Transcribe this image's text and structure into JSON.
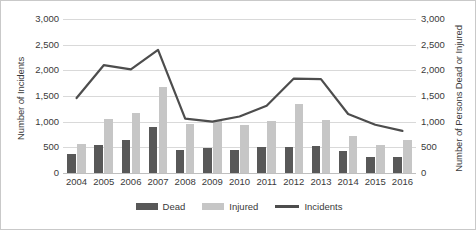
{
  "chart_data": {
    "type": "bar",
    "title": "",
    "subtitle": "",
    "xlabel": "",
    "ylabel": "Number of Incidents",
    "y2label": "Number of Persons Dead or Injured",
    "categories": [
      "2004",
      "2005",
      "2006",
      "2007",
      "2008",
      "2009",
      "2010",
      "2011",
      "2012",
      "2013",
      "2014",
      "2015",
      "2016"
    ],
    "ylim": [
      0,
      3000
    ],
    "y2lim": [
      0,
      3000
    ],
    "yticks": [
      0,
      500,
      1000,
      1500,
      2000,
      2500,
      3000
    ],
    "ytick_labels": [
      "0",
      "500",
      "1,000",
      "1,500",
      "2,000",
      "2,500",
      "3,000"
    ],
    "y2tick_labels": [
      "0",
      "500",
      "1,000",
      "1,500",
      "2,000",
      "2,500",
      "3,000"
    ],
    "grid": true,
    "legend_position": "bottom",
    "series": [
      {
        "name": "Dead",
        "type": "bar",
        "axis": "right",
        "color": "#585858",
        "values": [
          380,
          540,
          650,
          890,
          450,
          480,
          450,
          510,
          510,
          520,
          430,
          320,
          320
        ]
      },
      {
        "name": "Injured",
        "type": "bar",
        "axis": "right",
        "color": "#c6c6c6",
        "values": [
          560,
          1060,
          1170,
          1680,
          960,
          1020,
          930,
          1010,
          1350,
          1040,
          730,
          540,
          640
        ]
      },
      {
        "name": "Incidents",
        "type": "line",
        "axis": "left",
        "color": "#4d4d4d",
        "values": [
          1460,
          2100,
          2020,
          2400,
          1060,
          1000,
          1100,
          1310,
          1840,
          1830,
          1150,
          940,
          820
        ]
      }
    ]
  },
  "legend": {
    "items": [
      {
        "label": "Dead",
        "icon": "bar-swatch-dark"
      },
      {
        "label": "Injured",
        "icon": "bar-swatch-light"
      },
      {
        "label": "Incidents",
        "icon": "line-swatch"
      }
    ]
  }
}
